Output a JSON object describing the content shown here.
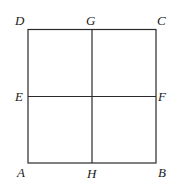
{
  "diagram": {
    "points": {
      "A": {
        "label": "A"
      },
      "B": {
        "label": "B"
      },
      "C": {
        "label": "C"
      },
      "D": {
        "label": "D"
      },
      "E": {
        "label": "E"
      },
      "F": {
        "label": "F"
      },
      "G": {
        "label": "G"
      },
      "H": {
        "label": "H"
      }
    },
    "segments": [
      {
        "from": "A",
        "to": "B"
      },
      {
        "from": "B",
        "to": "C"
      },
      {
        "from": "C",
        "to": "D"
      },
      {
        "from": "D",
        "to": "A"
      },
      {
        "from": "E",
        "to": "F"
      },
      {
        "from": "G",
        "to": "H"
      }
    ]
  }
}
